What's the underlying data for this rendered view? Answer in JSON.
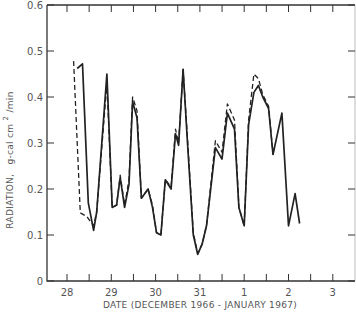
{
  "chart_data": {
    "type": "line",
    "title": "",
    "xlabel": "DATE (DECEMBER 1966 - JANUARY 1967)",
    "ylabel": "RADIATION,  g-cal cm²/min",
    "ylabel_main": "RADIATION,",
    "ylabel_units": "g-cal cm",
    "ylabel_sup": "2",
    "ylabel_tail": "/min",
    "xlim": [
      27.55,
      3.5
    ],
    "ylim": [
      0,
      0.6
    ],
    "grid": false,
    "legend": null,
    "x_ticks": [
      {
        "label": "28",
        "pos": 28
      },
      {
        "label": "29",
        "pos": 29
      },
      {
        "label": "30",
        "pos": 30
      },
      {
        "label": "31",
        "pos": 31
      },
      {
        "label": "1",
        "pos": 32
      },
      {
        "label": "2",
        "pos": 33
      },
      {
        "label": "3",
        "pos": 34
      }
    ],
    "y_ticks": [
      {
        "label": "0",
        "value": 0
      },
      {
        "label": "0.1",
        "value": 0.1
      },
      {
        "label": "0.2",
        "value": 0.2
      },
      {
        "label": "0.3",
        "value": 0.3
      },
      {
        "label": "0.4",
        "value": 0.4
      },
      {
        "label": "0.5",
        "value": 0.5
      },
      {
        "label": "0.6",
        "value": 0.6
      }
    ],
    "x_units": "day index (28=Dec 28, 32=Jan 1)",
    "series": [
      {
        "name": "solid",
        "style": "solid",
        "x": [
          28.23,
          28.35,
          28.48,
          28.6,
          28.67,
          28.9,
          29.02,
          29.12,
          29.2,
          29.3,
          29.4,
          29.48,
          29.58,
          29.68,
          29.83,
          29.93,
          30.02,
          30.12,
          30.22,
          30.35,
          30.45,
          30.52,
          30.62,
          30.72,
          30.85,
          30.95,
          31.05,
          31.15,
          31.35,
          31.5,
          31.62,
          31.78,
          31.88,
          32.0,
          32.1,
          32.22,
          32.32,
          32.42,
          32.55,
          32.65,
          32.85,
          33.0,
          33.15,
          33.25,
          33.4,
          33.5,
          33.6,
          33.72
        ],
        "y": [
          0.462,
          0.472,
          0.17,
          0.11,
          0.15,
          0.45,
          0.16,
          0.165,
          0.225,
          0.16,
          0.21,
          0.39,
          0.355,
          0.18,
          0.2,
          0.16,
          0.105,
          0.1,
          0.22,
          0.2,
          0.32,
          0.295,
          0.46,
          0.3,
          0.1,
          0.058,
          0.08,
          0.12,
          0.29,
          0.265,
          0.365,
          0.33,
          0.16,
          0.12,
          0.34,
          0.41,
          0.425,
          0.4,
          0.375,
          0.275,
          0.365,
          0.12,
          0.19,
          0.125,
          0.0,
          0.0,
          0.0,
          0.0
        ]
      },
      {
        "name": "dashed",
        "style": "dashed",
        "x": [
          28.15,
          28.3,
          28.45,
          28.6,
          28.67,
          28.9,
          29.02,
          29.12,
          29.2,
          29.3,
          29.4,
          29.48,
          29.58,
          29.68,
          29.83,
          29.93,
          30.02,
          30.12,
          30.22,
          30.35,
          30.45,
          30.52,
          30.62,
          30.72,
          30.85,
          30.95,
          31.05,
          31.15,
          31.35,
          31.5,
          31.62,
          31.78,
          31.88,
          32.0,
          32.1,
          32.22,
          32.32,
          32.42,
          32.55,
          32.65
        ],
        "y": [
          0.478,
          0.148,
          0.14,
          0.12,
          0.15,
          0.43,
          0.16,
          0.165,
          0.23,
          0.165,
          0.22,
          0.4,
          0.37,
          0.18,
          0.2,
          0.165,
          0.105,
          0.1,
          0.22,
          0.205,
          0.33,
          0.3,
          0.46,
          0.31,
          0.105,
          0.06,
          0.08,
          0.12,
          0.305,
          0.28,
          0.385,
          0.35,
          0.16,
          0.12,
          0.35,
          0.45,
          0.44,
          0.405,
          0.38,
          0.275
        ]
      }
    ]
  }
}
